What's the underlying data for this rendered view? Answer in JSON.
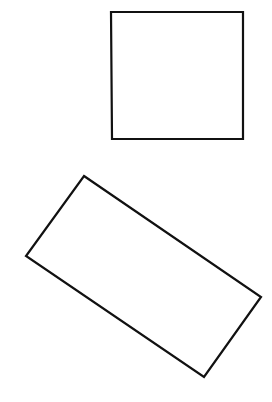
{
  "canvas": {
    "width": 272,
    "height": 402,
    "background": "#ffffff"
  },
  "stroke": {
    "color": "#111111",
    "width": 2.2
  },
  "shapes": [
    {
      "id": "square",
      "type": "polygon",
      "points": "111,12 243,12 243,139 112,139"
    },
    {
      "id": "rotated-rectangle",
      "type": "polygon",
      "points": "84,176 261,297 204,377 26,256"
    }
  ]
}
